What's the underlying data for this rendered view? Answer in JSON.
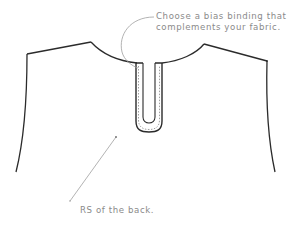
{
  "diagram": {
    "annotations": [
      {
        "id": "bias-binding-note",
        "lines": [
          "Choose a bias binding that",
          "complements your fabric."
        ]
      },
      {
        "id": "rs-back-note",
        "lines": [
          "RS of the back."
        ]
      }
    ],
    "colors": {
      "outline": "#2b2b2b",
      "leader_line": "#a0a0a0",
      "label_text": "#8a8a8a",
      "background": "#ffffff"
    }
  }
}
